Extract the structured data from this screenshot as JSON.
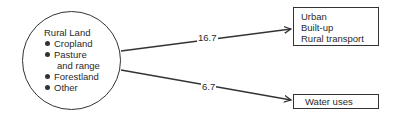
{
  "source": {
    "title": "Rural Land",
    "items": [
      "Cropland",
      "Pasture",
      "and range",
      "Forestland",
      "Other"
    ]
  },
  "flows": [
    {
      "value": "16.7",
      "target": [
        "Urban",
        "Built-up",
        "Rural transport"
      ]
    },
    {
      "value": "6.7",
      "target": [
        "Water uses"
      ]
    }
  ],
  "colors": {
    "line": "#333333",
    "background": "#ffffff"
  }
}
